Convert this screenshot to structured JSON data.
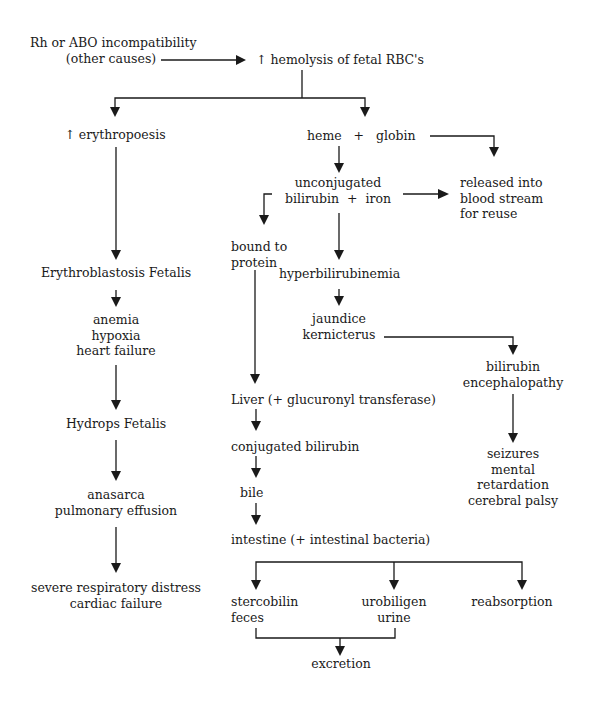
{
  "diagram": {
    "nodes": {
      "cause": "Rh or ABO incompatibility\n         (other causes)",
      "hemolysis": "↑ hemolysis of fetal RBC's",
      "erythropoesis": "↑ erythropoesis",
      "heme_globin": "heme   +   globin",
      "unconjugated": "unconjugated\nbilirubin  +  iron",
      "released": "released into\nblood stream\nfor reuse",
      "bound": "bound to\nprotein",
      "hyperbili": "hyperbilirubinemia",
      "erythroblastosis": "Erythroblastosis Fetalis",
      "jaundice": "jaundice\nkernicterus",
      "anemia": "anemia\nhypoxia\nheart failure",
      "encephalopathy": "bilirubin\nencephalopathy",
      "liver": "Liver (+ glucuronyl transferase)",
      "hydrops": "Hydrops Fetalis",
      "conjugated": "conjugated bilirubin",
      "seizures": "seizures\nmental\nretardation\ncerebral palsy",
      "bile": "bile",
      "anasarca": "anasarca\npulmonary effusion",
      "intestine": "intestine (+ intestinal bacteria)",
      "severe": "severe respiratory distress\ncardiac failure",
      "stercobilin": "stercobilin\nfeces",
      "urobiligen": "urobiligen\nurine",
      "reabsorption": "reabsorption",
      "excretion": "excretion"
    },
    "edges": [
      [
        "cause",
        "hemolysis"
      ],
      [
        "hemolysis",
        "erythropoesis"
      ],
      [
        "hemolysis",
        "heme_globin"
      ],
      [
        "heme_globin",
        "unconjugated"
      ],
      [
        "heme_globin",
        "released"
      ],
      [
        "unconjugated",
        "released"
      ],
      [
        "unconjugated",
        "bound"
      ],
      [
        "unconjugated",
        "hyperbili"
      ],
      [
        "erythropoesis",
        "erythroblastosis"
      ],
      [
        "erythroblastosis",
        "anemia"
      ],
      [
        "anemia",
        "hydrops"
      ],
      [
        "hydrops",
        "anasarca"
      ],
      [
        "anasarca",
        "severe"
      ],
      [
        "hyperbili",
        "jaundice"
      ],
      [
        "jaundice",
        "encephalopathy"
      ],
      [
        "encephalopathy",
        "seizures"
      ],
      [
        "bound",
        "liver"
      ],
      [
        "liver",
        "conjugated"
      ],
      [
        "conjugated",
        "bile"
      ],
      [
        "bile",
        "intestine"
      ],
      [
        "intestine",
        "stercobilin"
      ],
      [
        "intestine",
        "urobiligen"
      ],
      [
        "intestine",
        "reabsorption"
      ],
      [
        "stercobilin",
        "excretion"
      ],
      [
        "urobiligen",
        "excretion"
      ]
    ],
    "colors": {
      "line": "#1a1a1a",
      "text": "#1a1a1a",
      "background": "#ffffff"
    }
  }
}
